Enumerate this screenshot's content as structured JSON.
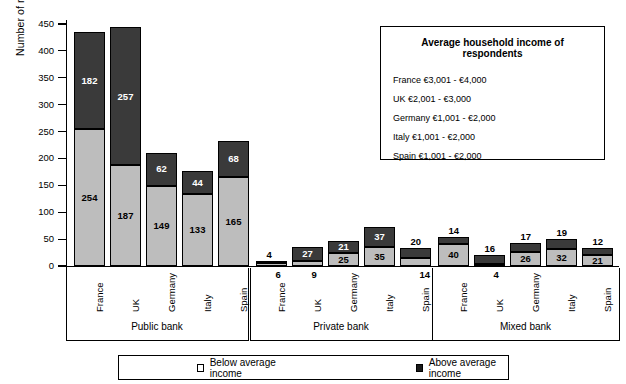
{
  "chart_data": {
    "type": "bar",
    "subtype": "stacked-grouped",
    "title": "",
    "xlabel": "",
    "ylabel": "Number of respondents",
    "ylim": [
      0,
      450
    ],
    "ytick_values": [
      0,
      50,
      100,
      150,
      200,
      250,
      300,
      350,
      400,
      450
    ],
    "ytick_labels": [
      "0",
      "50",
      "100",
      "150",
      "200",
      "250",
      "300",
      "350",
      "400",
      "450"
    ],
    "grid": false,
    "legend_position": "bottom",
    "legend": [
      "Below average income",
      "Above average income"
    ],
    "categories": [
      "France",
      "UK",
      "Germany",
      "Italy",
      "Spain"
    ],
    "groups": [
      "Public bank",
      "Private bank",
      "Mixed bank"
    ],
    "series": [
      {
        "name": "Below average income",
        "color": "#bdbdbd",
        "values_by_group": {
          "Public bank": [
            254,
            187,
            149,
            133,
            165
          ],
          "Private bank": [
            6,
            9,
            25,
            35,
            14
          ],
          "Mixed bank": [
            40,
            4,
            26,
            32,
            21
          ]
        }
      },
      {
        "name": "Above average income",
        "color": "#3a3a3a",
        "values_by_group": {
          "Public bank": [
            182,
            257,
            62,
            44,
            68
          ],
          "Private bank": [
            4,
            27,
            21,
            37,
            20
          ],
          "Mixed bank": [
            14,
            16,
            17,
            19,
            12
          ]
        }
      }
    ],
    "bars": [
      {
        "group": "Public bank",
        "category": "France",
        "below": 254,
        "above": 182,
        "total": 436
      },
      {
        "group": "Public bank",
        "category": "UK",
        "below": 187,
        "above": 257,
        "total": 444
      },
      {
        "group": "Public bank",
        "category": "Germany",
        "below": 149,
        "above": 62,
        "total": 211
      },
      {
        "group": "Public bank",
        "category": "Italy",
        "below": 133,
        "above": 44,
        "total": 177
      },
      {
        "group": "Public bank",
        "category": "Spain",
        "below": 165,
        "above": 68,
        "total": 233
      },
      {
        "group": "Private bank",
        "category": "France",
        "below": 6,
        "above": 4,
        "total": 10
      },
      {
        "group": "Private bank",
        "category": "UK",
        "below": 9,
        "above": 27,
        "total": 36
      },
      {
        "group": "Private bank",
        "category": "Germany",
        "below": 25,
        "above": 21,
        "total": 46
      },
      {
        "group": "Private bank",
        "category": "Italy",
        "below": 35,
        "above": 37,
        "total": 72
      },
      {
        "group": "Private bank",
        "category": "Spain",
        "below": 14,
        "above": 20,
        "total": 34
      },
      {
        "group": "Mixed bank",
        "category": "France",
        "below": 40,
        "above": 14,
        "total": 54
      },
      {
        "group": "Mixed bank",
        "category": "UK",
        "below": 4,
        "above": 16,
        "total": 20
      },
      {
        "group": "Mixed bank",
        "category": "Germany",
        "below": 26,
        "above": 17,
        "total": 43
      },
      {
        "group": "Mixed bank",
        "category": "Italy",
        "below": 32,
        "above": 19,
        "total": 51
      },
      {
        "group": "Mixed bank",
        "category": "Spain",
        "below": 21,
        "above": 12,
        "total": 33
      }
    ]
  },
  "info_box": {
    "title": "Average household income of respondents",
    "rows": [
      "France €3,001 - €4,000",
      "UK €2,001 - €3,000",
      "Germany €1,001 - €2,000",
      "Italy €1,001 - €2,000",
      "Spain €1,001 - €2,000"
    ]
  },
  "legend": {
    "below_label": "Below average income",
    "above_label": "Above average income",
    "below_color": "#ffffff",
    "above_color": "#1a1a1a"
  }
}
